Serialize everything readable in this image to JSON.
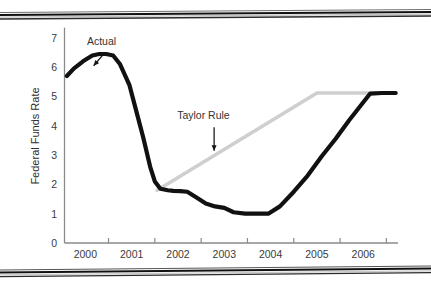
{
  "figure": {
    "background_color": "#ffffff",
    "border_note": "scanned-page double rule at top and bottom",
    "rule_color_dark": "#1a1a1a",
    "rule_color_light": "#b9b9b9"
  },
  "chart_data": {
    "type": "line",
    "title": "",
    "subtitle": "",
    "xlabel": "",
    "ylabel": "Federal Funds Rate",
    "xlim": [
      1999.55,
      2006.75
    ],
    "ylim": [
      0,
      7.35
    ],
    "xticks": [
      2000,
      2001,
      2002,
      2003,
      2004,
      2005,
      2006
    ],
    "xtick_labels": [
      "2000",
      "2001",
      "2002",
      "2003",
      "2004",
      "2005",
      "2006"
    ],
    "yticks": [
      0,
      1,
      2,
      3,
      4,
      5,
      6,
      7
    ],
    "ytick_labels": [
      "0",
      "1",
      "2",
      "3",
      "4",
      "5",
      "6",
      "7"
    ],
    "grid": false,
    "legend": "inline annotations with arrows",
    "axis_color": "#8a8a8a",
    "series": [
      {
        "name": "Actual",
        "color": "#111111",
        "line_width": 4.2,
        "label_position": {
          "x": 2000.35,
          "y": 6.75
        },
        "arrow_from": {
          "x": 2000.42,
          "y": 6.5
        },
        "arrow_to": {
          "x": 2000.18,
          "y": 6.05
        },
        "x": [
          1999.6,
          1999.75,
          1999.95,
          2000.15,
          2000.3,
          2000.45,
          2000.6,
          2000.75,
          2000.95,
          2001.1,
          2001.25,
          2001.4,
          2001.5,
          2001.62,
          2001.78,
          2001.9,
          2002.05,
          2002.2,
          2002.4,
          2002.6,
          2002.8,
          2003.0,
          2003.2,
          2003.45,
          2003.7,
          2003.95,
          2004.2,
          2004.5,
          2004.8,
          2005.1,
          2005.4,
          2005.7,
          2005.95,
          2006.15,
          2006.4,
          2006.7
        ],
        "y": [
          5.7,
          5.95,
          6.2,
          6.4,
          6.45,
          6.45,
          6.4,
          6.1,
          5.4,
          4.5,
          3.6,
          2.6,
          2.1,
          1.85,
          1.8,
          1.78,
          1.77,
          1.75,
          1.55,
          1.35,
          1.25,
          1.2,
          1.05,
          1.0,
          1.0,
          1.0,
          1.25,
          1.75,
          2.3,
          2.95,
          3.55,
          4.2,
          4.7,
          5.1,
          5.12,
          5.12
        ]
      },
      {
        "name": "Taylor Rule",
        "color": "#cfcfcf",
        "line_width": 3.6,
        "label_position": {
          "x": 2002.55,
          "y": 4.22
        },
        "arrow_from": {
          "x": 2002.78,
          "y": 3.95
        },
        "arrow_to": {
          "x": 2002.78,
          "y": 3.15
        },
        "x": [
          2001.55,
          2005.0,
          2006.7
        ],
        "y": [
          1.8,
          5.12,
          5.12
        ]
      }
    ]
  }
}
